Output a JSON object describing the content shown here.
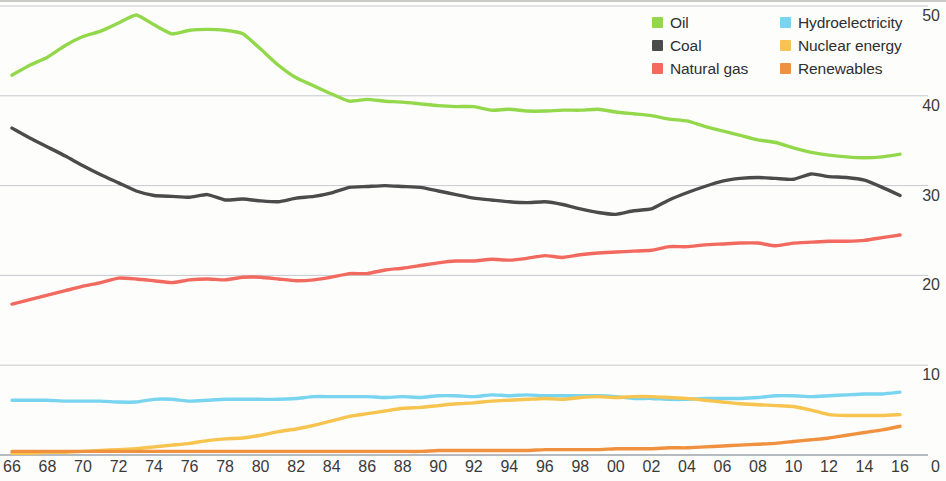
{
  "chart_data": {
    "type": "line",
    "title": "",
    "subtitle": "",
    "xlabel": "",
    "ylabel": "",
    "xlim": [
      1966,
      2016
    ],
    "ylim": [
      0,
      50
    ],
    "y_ticks": [
      0,
      10,
      20,
      30,
      40,
      50
    ],
    "y_tick_labels": [
      "0",
      "10",
      "20",
      "30",
      "40",
      "50"
    ],
    "grid": true,
    "grid_axis": "y",
    "legend_position": "top-right",
    "x": [
      1966,
      1967,
      1968,
      1969,
      1970,
      1971,
      1972,
      1973,
      1974,
      1975,
      1976,
      1977,
      1978,
      1979,
      1980,
      1981,
      1982,
      1983,
      1984,
      1985,
      1986,
      1987,
      1988,
      1989,
      1990,
      1991,
      1992,
      1993,
      1994,
      1995,
      1996,
      1997,
      1998,
      1999,
      2000,
      2001,
      2002,
      2003,
      2004,
      2005,
      2006,
      2007,
      2008,
      2009,
      2010,
      2011,
      2012,
      2013,
      2014,
      2015,
      2016
    ],
    "x_tick_labels": [
      "66",
      "68",
      "70",
      "72",
      "74",
      "76",
      "78",
      "80",
      "82",
      "84",
      "86",
      "88",
      "90",
      "92",
      "94",
      "96",
      "98",
      "00",
      "02",
      "04",
      "06",
      "08",
      "10",
      "12",
      "14",
      "16",
      "0"
    ],
    "x_tick_values": [
      1966,
      1968,
      1970,
      1972,
      1974,
      1976,
      1978,
      1980,
      1982,
      1984,
      1986,
      1988,
      1990,
      1992,
      1994,
      1996,
      1998,
      2000,
      2002,
      2004,
      2006,
      2008,
      2010,
      2012,
      2014,
      2016,
      2018
    ],
    "series": [
      {
        "name": "Oil",
        "color": "#93d84a",
        "values": [
          42.3,
          43.4,
          44.3,
          45.6,
          46.6,
          47.2,
          48.1,
          49.0,
          47.9,
          46.9,
          47.3,
          47.4,
          47.3,
          46.9,
          45.2,
          43.4,
          42.0,
          41.1,
          40.2,
          39.4,
          39.6,
          39.4,
          39.3,
          39.1,
          38.9,
          38.8,
          38.8,
          38.4,
          38.5,
          38.3,
          38.3,
          38.4,
          38.4,
          38.5,
          38.2,
          38.0,
          37.8,
          37.4,
          37.2,
          36.6,
          36.1,
          35.6,
          35.1,
          34.8,
          34.2,
          33.7,
          33.4,
          33.2,
          33.1,
          33.2,
          33.5
        ]
      },
      {
        "name": "Coal",
        "color": "#4b4b4b",
        "values": [
          36.4,
          35.3,
          34.3,
          33.3,
          32.2,
          31.2,
          30.3,
          29.4,
          28.9,
          28.8,
          28.7,
          29.0,
          28.4,
          28.5,
          28.3,
          28.2,
          28.6,
          28.8,
          29.2,
          29.8,
          29.9,
          30.0,
          29.9,
          29.8,
          29.4,
          29.0,
          28.6,
          28.4,
          28.2,
          28.1,
          28.2,
          27.9,
          27.4,
          27.0,
          26.8,
          27.2,
          27.4,
          28.4,
          29.2,
          29.9,
          30.5,
          30.8,
          30.9,
          30.8,
          30.7,
          31.3,
          31.0,
          30.9,
          30.6,
          29.8,
          28.9
        ]
      },
      {
        "name": "Natural gas",
        "color": "#f26a5f",
        "values": [
          16.8,
          17.3,
          17.8,
          18.3,
          18.8,
          19.2,
          19.7,
          19.6,
          19.4,
          19.2,
          19.5,
          19.6,
          19.5,
          19.8,
          19.8,
          19.6,
          19.4,
          19.5,
          19.8,
          20.2,
          20.2,
          20.6,
          20.8,
          21.1,
          21.4,
          21.6,
          21.6,
          21.8,
          21.7,
          21.9,
          22.2,
          22.0,
          22.3,
          22.5,
          22.6,
          22.7,
          22.8,
          23.2,
          23.2,
          23.4,
          23.5,
          23.6,
          23.6,
          23.3,
          23.6,
          23.7,
          23.8,
          23.8,
          23.9,
          24.2,
          24.5
        ]
      },
      {
        "name": "Hydroelectricity",
        "color": "#79d4f0",
        "values": [
          6.1,
          6.1,
          6.1,
          6.0,
          6.0,
          6.0,
          5.9,
          5.9,
          6.2,
          6.2,
          6.0,
          6.1,
          6.2,
          6.2,
          6.2,
          6.2,
          6.3,
          6.5,
          6.5,
          6.5,
          6.5,
          6.4,
          6.5,
          6.4,
          6.6,
          6.6,
          6.5,
          6.7,
          6.6,
          6.7,
          6.6,
          6.6,
          6.6,
          6.6,
          6.5,
          6.3,
          6.3,
          6.2,
          6.2,
          6.3,
          6.3,
          6.3,
          6.4,
          6.6,
          6.6,
          6.5,
          6.6,
          6.7,
          6.8,
          6.8,
          7.0
        ]
      },
      {
        "name": "Nuclear energy",
        "color": "#f6c44f",
        "values": [
          0.2,
          0.2,
          0.3,
          0.3,
          0.4,
          0.5,
          0.6,
          0.7,
          0.9,
          1.1,
          1.3,
          1.6,
          1.8,
          1.9,
          2.2,
          2.6,
          2.9,
          3.3,
          3.8,
          4.3,
          4.6,
          4.9,
          5.2,
          5.3,
          5.5,
          5.7,
          5.8,
          6.0,
          6.1,
          6.2,
          6.3,
          6.2,
          6.4,
          6.5,
          6.4,
          6.5,
          6.5,
          6.4,
          6.3,
          6.1,
          5.9,
          5.7,
          5.6,
          5.5,
          5.4,
          5.0,
          4.5,
          4.4,
          4.4,
          4.4,
          4.5
        ]
      },
      {
        "name": "Renewables",
        "color": "#f0913f",
        "values": [
          0.4,
          0.4,
          0.4,
          0.4,
          0.4,
          0.4,
          0.4,
          0.4,
          0.4,
          0.4,
          0.4,
          0.4,
          0.4,
          0.4,
          0.4,
          0.4,
          0.4,
          0.4,
          0.4,
          0.4,
          0.4,
          0.4,
          0.4,
          0.4,
          0.5,
          0.5,
          0.5,
          0.5,
          0.5,
          0.5,
          0.6,
          0.6,
          0.6,
          0.6,
          0.7,
          0.7,
          0.7,
          0.8,
          0.8,
          0.9,
          1.0,
          1.1,
          1.2,
          1.3,
          1.5,
          1.7,
          1.9,
          2.2,
          2.5,
          2.8,
          3.2
        ]
      }
    ]
  },
  "legend": {
    "columns": [
      [
        {
          "label": "Oil",
          "color": "#93d84a",
          "icon": "legend-swatch-oil"
        },
        {
          "label": "Coal",
          "color": "#4b4b4b",
          "icon": "legend-swatch-coal"
        },
        {
          "label": "Natural gas",
          "color": "#f26a5f",
          "icon": "legend-swatch-natural-gas"
        }
      ],
      [
        {
          "label": "Hydroelectricity",
          "color": "#79d4f0",
          "icon": "legend-swatch-hydroelectricity"
        },
        {
          "label": "Nuclear energy",
          "color": "#f6c44f",
          "icon": "legend-swatch-nuclear-energy"
        },
        {
          "label": "Renewables",
          "color": "#f0913f",
          "icon": "legend-swatch-renewables"
        }
      ]
    ]
  },
  "axes": {
    "y_right_labels": [
      "50",
      "40",
      "30",
      "20",
      "10"
    ],
    "x_bottom_labels": [
      "66",
      "68",
      "70",
      "72",
      "74",
      "76",
      "78",
      "80",
      "82",
      "84",
      "86",
      "88",
      "90",
      "92",
      "94",
      "96",
      "98",
      "00",
      "02",
      "04",
      "06",
      "08",
      "10",
      "12",
      "14",
      "16",
      "0"
    ]
  },
  "colors": {
    "grid": "#9aa0aa",
    "axis": "#6b6b6b",
    "text": "#3a3a3a",
    "background": "#fdfdfc"
  }
}
